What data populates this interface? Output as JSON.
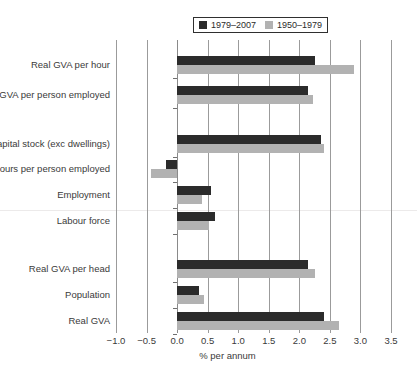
{
  "chart_data": {
    "type": "bar",
    "orientation": "horizontal",
    "title": "",
    "xlabel": "% per annum",
    "ylabel": "",
    "xlim": [
      -1.0,
      3.5
    ],
    "xticks": [
      -1.0,
      -0.5,
      0.0,
      0.5,
      1.0,
      1.5,
      2.0,
      2.5,
      3.0,
      3.5
    ],
    "xtick_labels": [
      "−1.0",
      "−0.5",
      "0.0",
      "0.5",
      "1.0",
      "1.5",
      "2.0",
      "2.5",
      "3.0",
      "3.5"
    ],
    "grid": true,
    "legend_position": "top",
    "categories": [
      "Real GVA per hour",
      "Real GVA per person employed",
      "Capital stock (exc dwellings)",
      "Hours per person employed",
      "Employment",
      "Labour force",
      "Real GVA per head",
      "Population",
      "Real GVA"
    ],
    "series": [
      {
        "name": "1979–2007",
        "color": "#2b2b2b",
        "values": [
          2.25,
          2.15,
          2.35,
          -0.18,
          0.56,
          0.62,
          2.15,
          0.36,
          2.4
        ]
      },
      {
        "name": "1950–1979",
        "color": "#b2b2b2",
        "values": [
          2.9,
          2.22,
          2.4,
          -0.42,
          0.41,
          0.53,
          2.25,
          0.44,
          2.65
        ]
      }
    ]
  },
  "legend": {
    "entries": [
      {
        "label": "1979–2007",
        "swatch_name": "legend-swatch-dark"
      },
      {
        "label": "1950–1979",
        "swatch_name": "legend-swatch-light"
      }
    ]
  },
  "axis": {
    "x_title": "% per annum"
  },
  "caption": {
    "text": ""
  }
}
